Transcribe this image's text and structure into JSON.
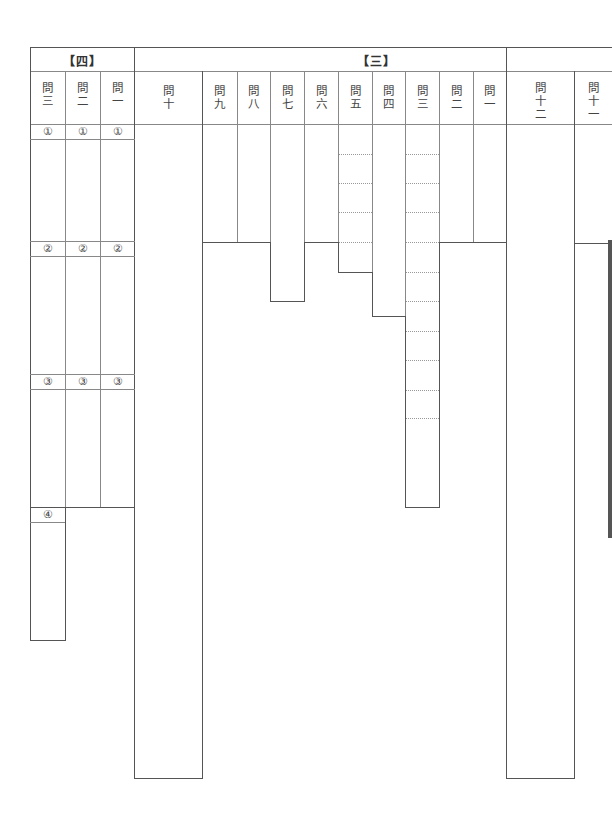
{
  "sheet": {
    "sections": [
      {
        "label": "【四】",
        "questions": [
          "問三",
          "問二",
          "問一"
        ]
      },
      {
        "label": "【三】",
        "questions": [
          "問十",
          "問九",
          "問八",
          "問七",
          "問六",
          "問五",
          "問四",
          "問三",
          "問二",
          "問一"
        ]
      },
      {
        "label": "",
        "questions": [
          "問十二",
          "問十一"
        ]
      }
    ],
    "section4": {
      "header": "【四】",
      "q3": {
        "chars": [
          "問",
          "三"
        ],
        "subs": [
          "①",
          "②",
          "③",
          "④"
        ]
      },
      "q2": {
        "chars": [
          "問",
          "二"
        ],
        "subs": [
          "①",
          "②",
          "③"
        ]
      },
      "q1": {
        "chars": [
          "問",
          "一"
        ],
        "subs": [
          "①",
          "②",
          "③"
        ]
      }
    },
    "section3": {
      "header": "【三】",
      "q10": [
        "問",
        "十"
      ],
      "q9": [
        "問",
        "九"
      ],
      "q8": [
        "問",
        "八"
      ],
      "q7": [
        "問",
        "七"
      ],
      "q6": [
        "問",
        "六"
      ],
      "q5": [
        "問",
        "五"
      ],
      "q4": [
        "問",
        "四"
      ],
      "q3": [
        "問",
        "三"
      ],
      "q2": [
        "問",
        "二"
      ],
      "q1": [
        "問",
        "一"
      ]
    },
    "section2": {
      "q12": [
        "問",
        "十",
        "二"
      ],
      "q11": [
        "問",
        "十",
        "一"
      ]
    }
  }
}
